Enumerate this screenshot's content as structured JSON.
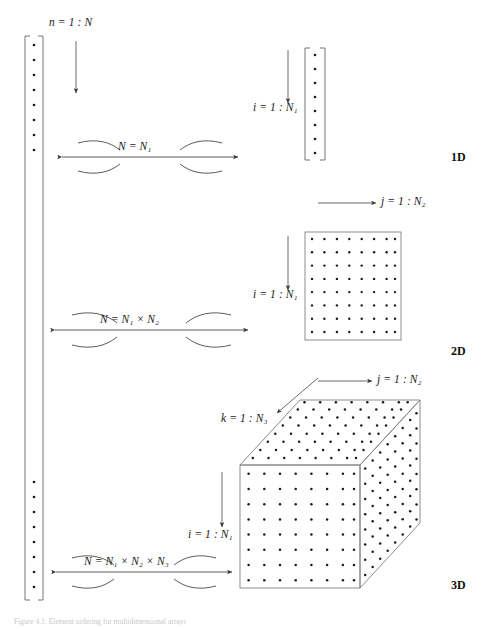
{
  "figure": {
    "caption": "Figure 4.1:  Element ordering for multidimensional arrays",
    "background": "#ffffff",
    "stroke_color": "#555555",
    "dot_color": "#1a1a1a",
    "text_color": "#1a1a1a"
  },
  "linear_vector": {
    "name": "linear-index-column",
    "index_label": "n = 1 : N",
    "index_var": "n",
    "range_start": "1",
    "range_end": "N",
    "dots_top": 8,
    "dots_bottom": 8,
    "bracket_left_x": 25,
    "bracket_right_x": 43,
    "bracket_top_y": 36,
    "bracket_bottom_y": 600
  },
  "rows": [
    {
      "id": "row-1d",
      "dim_label": "1D",
      "equivalence": {
        "text": "N = N₁",
        "plain": "N = N1",
        "parts": [
          "N",
          "=",
          "N",
          "1"
        ]
      },
      "index_labels": [
        {
          "var": "i",
          "text": "i = 1 : N₁",
          "plain": "i = 1 : N1",
          "orientation": "vertical"
        }
      ],
      "shape": {
        "kind": "column-vector",
        "dot_rows": 8,
        "dot_cols": 1
      }
    },
    {
      "id": "row-2d",
      "dim_label": "2D",
      "equivalence": {
        "text": "N = N₁ × N₂",
        "plain": "N = N1 x N2",
        "parts": [
          "N",
          "=",
          "N",
          "1",
          "×",
          "N",
          "2"
        ]
      },
      "index_labels": [
        {
          "var": "j",
          "text": "j = 1 : N₂",
          "plain": "j = 1 : N2",
          "orientation": "horizontal"
        },
        {
          "var": "i",
          "text": "i = 1 : N₁",
          "plain": "i = 1 : N1",
          "orientation": "vertical"
        }
      ],
      "shape": {
        "kind": "square-grid",
        "dot_rows": 8,
        "dot_cols": 8
      }
    },
    {
      "id": "row-3d",
      "dim_label": "3D",
      "equivalence": {
        "text": "N = N₁ × N₂ × N₃",
        "plain": "N = N1 x N2 x N3",
        "parts": [
          "N",
          "=",
          "N",
          "1",
          "×",
          "N",
          "2",
          "×",
          "N",
          "3"
        ]
      },
      "index_labels": [
        {
          "var": "j",
          "text": "j = 1 : N₂",
          "plain": "j = 1 : N2",
          "orientation": "horizontal"
        },
        {
          "var": "k",
          "text": "k = 1 : N₃",
          "plain": "k = 1 : N3",
          "orientation": "diagonal"
        },
        {
          "var": "i",
          "text": "i = 1 : N₁",
          "plain": "i = 1 : N1",
          "orientation": "vertical"
        }
      ],
      "shape": {
        "kind": "cube",
        "dot_rows": 8,
        "dot_cols": 8,
        "dot_depth": 8
      }
    }
  ],
  "labels": {
    "n_index": "n = 1 : N",
    "i_index": "i = 1 : N₁",
    "j_index": "j = 1 : N₂",
    "k_index": "k = 1 : N₃",
    "eq_1d": "N = N₁",
    "eq_2d": "N = N₁ × N₂",
    "eq_3d": "N = N₁ × N₂ × N₃",
    "dim_1d": "1D",
    "dim_2d": "2D",
    "dim_3d": "3D"
  }
}
